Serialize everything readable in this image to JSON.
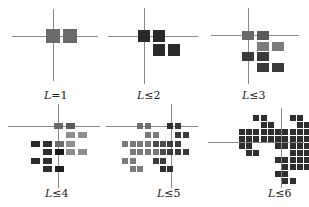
{
  "figure": {
    "panels": [
      {
        "label": "L=1",
        "label_var": "L",
        "label_rel": "=1"
      },
      {
        "label": "L≤2",
        "label_var": "L",
        "label_rel": "≤2"
      },
      {
        "label": "L≤3",
        "label_var": "L",
        "label_rel": "≤3"
      },
      {
        "label": "L≤4",
        "label_var": "L",
        "label_rel": "≤4"
      },
      {
        "label": "L≤5",
        "label_var": "L",
        "label_rel": "≤5"
      },
      {
        "label": "L≤6",
        "label_var": "L",
        "label_rel": "≤6"
      }
    ],
    "colors": {
      "axis": "#8a8a8a",
      "mid_gray": "#6e6e6e",
      "dark": "#2e2e2e",
      "light_gray": "#8c8c8c",
      "black": "#1e1e1e"
    }
  }
}
